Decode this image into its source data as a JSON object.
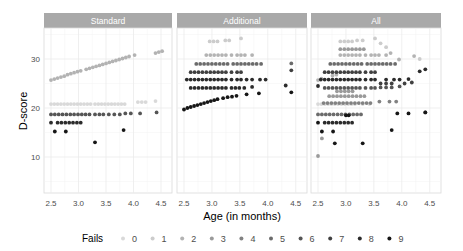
{
  "chart_data": {
    "type": "scatter",
    "title": "",
    "xlabel": "Age (in months)",
    "ylabel": "D-score",
    "xlim": [
      2.4,
      4.6
    ],
    "ylim": [
      3,
      36.5
    ],
    "xticks": [
      2.5,
      3.0,
      3.5,
      4.0,
      4.5
    ],
    "xtick_labels": [
      "2.5",
      "3.0",
      "3.5",
      "4.0",
      "4.5"
    ],
    "yticks": [
      10,
      20,
      30
    ],
    "ytick_labels": [
      "10",
      "20",
      "30"
    ],
    "grid": true,
    "legend_position": "bottom",
    "legend_title": "Fails",
    "legend": [
      {
        "label": "0",
        "color": "#d9d9d9"
      },
      {
        "label": "1",
        "color": "#cccccc"
      },
      {
        "label": "2",
        "color": "#b3b3b3"
      },
      {
        "label": "3",
        "color": "#9a9a9a"
      },
      {
        "label": "4",
        "color": "#828282"
      },
      {
        "label": "5",
        "color": "#6b6b6b"
      },
      {
        "label": "6",
        "color": "#555555"
      },
      {
        "label": "7",
        "color": "#404040"
      },
      {
        "label": "8",
        "color": "#2b2b2b"
      },
      {
        "label": "9",
        "color": "#161616"
      }
    ],
    "panels": [
      {
        "name": "Standard",
        "series": [
          {
            "fails": "2",
            "x": [
              2.5,
              2.56,
              2.62,
              2.68,
              2.74,
              2.8,
              2.86,
              2.92,
              2.98,
              3.04,
              3.14,
              3.2,
              3.26,
              3.32,
              3.38,
              3.44,
              3.5,
              3.56,
              3.62,
              3.68,
              3.74,
              3.8,
              3.86,
              3.92,
              4.02,
              4.4,
              4.46,
              4.52
            ],
            "y": [
              25.7,
              25.9,
              26.1,
              26.3,
              26.5,
              26.8,
              27.0,
              27.2,
              27.4,
              27.6,
              27.9,
              28.1,
              28.3,
              28.5,
              28.7,
              28.9,
              29.1,
              29.3,
              29.5,
              29.7,
              29.9,
              30.1,
              30.3,
              30.5,
              30.8,
              31.2,
              31.4,
              31.6
            ]
          },
          {
            "fails": "0",
            "x": [
              2.5,
              2.56,
              2.62,
              2.68,
              2.74,
              2.8,
              2.86,
              2.92,
              2.98,
              3.04,
              3.1,
              3.16,
              3.22,
              3.3,
              3.36,
              3.42,
              3.48,
              3.54,
              3.6,
              3.66,
              3.72,
              3.78,
              3.84,
              4.08,
              4.15,
              4.22,
              4.4
            ],
            "y": [
              20.8,
              20.8,
              20.8,
              20.8,
              20.8,
              20.8,
              20.8,
              20.8,
              20.8,
              20.8,
              20.8,
              20.8,
              20.8,
              20.8,
              20.8,
              20.8,
              20.8,
              20.8,
              20.8,
              20.8,
              20.8,
              20.8,
              20.8,
              21.2,
              21.2,
              21.2,
              21.4
            ]
          },
          {
            "fails": "6",
            "x": [
              2.5,
              2.57,
              2.64,
              2.71,
              2.78,
              2.85,
              2.92,
              2.99,
              3.06,
              3.13,
              3.2,
              3.3,
              3.38,
              3.45,
              3.55,
              3.65,
              3.75,
              3.85,
              3.95,
              4.12,
              4.42
            ],
            "y": [
              18.7,
              18.7,
              18.7,
              18.7,
              18.7,
              18.7,
              18.7,
              18.7,
              18.7,
              18.7,
              18.7,
              18.7,
              18.7,
              18.7,
              18.7,
              18.7,
              18.7,
              18.9,
              18.9,
              18.9,
              19.1
            ]
          },
          {
            "fails": "8",
            "x": [
              2.5,
              2.62,
              2.69,
              2.76,
              2.83,
              2.9,
              2.97,
              3.04
            ],
            "y": [
              17.0,
              17.0,
              17.0,
              17.0,
              17.0,
              17.0,
              17.0,
              17.0
            ]
          },
          {
            "fails": "9",
            "x": [
              2.57,
              2.77,
              3.3,
              3.82
            ],
            "y": [
              15.2,
              15.2,
              13.0,
              15.5
            ]
          }
        ]
      },
      {
        "name": "Additional",
        "series": [
          {
            "fails": "1",
            "x": [
              2.96,
              3.03,
              3.1,
              3.24,
              3.31,
              3.52
            ],
            "y": [
              33.6,
              33.6,
              33.6,
              33.8,
              33.8,
              34.2
            ]
          },
          {
            "fails": "2",
            "x": [
              2.9,
              2.97,
              3.04,
              3.11,
              3.18,
              3.25,
              3.35,
              3.45,
              3.52,
              3.59,
              3.72
            ],
            "y": [
              30.8,
              30.8,
              30.8,
              30.8,
              30.8,
              30.8,
              30.8,
              30.8,
              30.8,
              30.8,
              30.8
            ]
          },
          {
            "fails": "5",
            "x": [
              2.72,
              2.79,
              2.86,
              2.93,
              3.0,
              3.07,
              3.14,
              3.21,
              3.28,
              3.38,
              3.45,
              3.52,
              3.59,
              3.66,
              3.73,
              3.8,
              3.88,
              4.42
            ],
            "y": [
              29.0,
              29.0,
              29.0,
              29.0,
              29.0,
              29.0,
              29.0,
              29.0,
              29.0,
              29.0,
              29.0,
              29.0,
              29.0,
              29.0,
              29.0,
              29.0,
              29.0,
              29.1
            ]
          },
          {
            "fails": "7",
            "x": [
              2.62,
              2.69,
              2.76,
              2.83,
              2.9,
              2.97,
              3.04,
              3.11,
              3.18,
              3.25,
              3.35,
              3.45,
              3.52,
              4.42
            ],
            "y": [
              27.3,
              27.3,
              27.3,
              27.3,
              27.3,
              27.3,
              27.3,
              27.3,
              27.3,
              27.3,
              27.3,
              27.3,
              27.3,
              27.7
            ]
          },
          {
            "fails": "8",
            "x": [
              2.55,
              2.62,
              2.69,
              2.76,
              2.83,
              2.9,
              2.97,
              3.04,
              3.11,
              3.18,
              3.25,
              3.35,
              3.45,
              3.52,
              3.62,
              3.72,
              3.86,
              3.96
            ],
            "y": [
              25.8,
              25.8,
              25.8,
              25.8,
              25.8,
              25.8,
              25.8,
              25.8,
              25.8,
              25.8,
              25.8,
              25.8,
              25.8,
              25.8,
              25.8,
              25.8,
              25.8,
              25.8
            ]
          },
          {
            "fails": "8",
            "x": [
              2.62,
              2.69,
              2.76,
              2.83,
              2.9,
              2.97,
              3.04,
              3.11,
              3.18,
              3.25,
              3.35,
              3.42,
              3.49,
              3.58,
              3.72,
              4.32
            ],
            "y": [
              24.1,
              24.1,
              24.1,
              24.1,
              24.1,
              24.1,
              24.1,
              24.1,
              24.1,
              24.1,
              24.1,
              24.1,
              24.1,
              24.1,
              24.3,
              24.6
            ]
          },
          {
            "fails": "9",
            "x": [
              2.5,
              2.56,
              2.62,
              2.68,
              2.74,
              2.8,
              2.86,
              2.92,
              2.98,
              3.04,
              3.1,
              3.2,
              3.28,
              3.36,
              3.44,
              3.62,
              3.84,
              4.42
            ],
            "y": [
              19.7,
              20.0,
              20.2,
              20.4,
              20.6,
              20.8,
              21.0,
              21.2,
              21.4,
              21.6,
              21.8,
              22.0,
              22.2,
              22.3,
              22.5,
              22.8,
              23.0,
              23.2
            ]
          }
        ]
      },
      {
        "name": "All",
        "series": [
          {
            "fails": "0",
            "x": [
              2.5,
              2.56,
              2.62,
              2.68,
              2.74,
              2.8,
              2.86,
              2.92,
              2.98,
              3.04,
              3.1,
              3.16,
              3.3,
              3.42
            ],
            "y": [
              20.8,
              20.8,
              20.8,
              20.8,
              20.8,
              20.8,
              20.8,
              20.8,
              20.8,
              20.8,
              20.8,
              20.8,
              20.8,
              20.8
            ]
          },
          {
            "fails": "1",
            "x": [
              2.9,
              2.97,
              3.04,
              3.11,
              3.2,
              3.3,
              3.52,
              3.62,
              3.72,
              4.32
            ],
            "y": [
              33.6,
              33.6,
              33.6,
              33.6,
              33.8,
              33.8,
              34.2,
              33.2,
              32.4,
              30.0
            ]
          },
          {
            "fails": "2",
            "x": [
              2.5,
              2.56,
              2.76,
              2.83,
              2.9,
              2.97,
              3.04,
              3.11,
              3.18,
              3.25,
              3.35,
              3.45,
              3.52,
              3.59,
              3.72,
              3.8,
              3.95,
              4.22
            ],
            "y": [
              25.7,
              26.0,
              26.6,
              26.8,
              30.8,
              30.8,
              30.8,
              30.8,
              30.8,
              30.8,
              30.8,
              30.8,
              30.8,
              30.8,
              30.8,
              31.2,
              29.9,
              30.6
            ]
          },
          {
            "fails": "3",
            "x": [
              2.7,
              2.77,
              2.84,
              2.91,
              2.98,
              3.05,
              3.12,
              3.19,
              3.26,
              3.33,
              2.9,
              2.97,
              3.04,
              3.11,
              3.18,
              3.25,
              3.32,
              2.84,
              2.91,
              2.98,
              3.05,
              3.12
            ],
            "y": [
              22.4,
              22.4,
              22.4,
              22.4,
              22.4,
              22.4,
              22.4,
              22.4,
              22.4,
              22.4,
              32.0,
              32.0,
              32.0,
              32.0,
              32.0,
              32.0,
              32.0,
              23.4,
              23.4,
              23.4,
              23.4,
              23.4
            ]
          },
          {
            "fails": "4",
            "x": [
              2.6,
              2.67,
              2.74,
              2.81,
              2.88,
              2.95,
              3.02,
              3.09,
              3.16,
              3.23,
              3.3,
              3.37,
              3.44,
              3.6,
              3.78,
              3.9
            ],
            "y": [
              21.0,
              21.0,
              21.0,
              21.0,
              21.0,
              21.0,
              21.0,
              21.0,
              21.0,
              21.0,
              21.0,
              21.0,
              21.0,
              21.3,
              21.3,
              21.3
            ]
          },
          {
            "fails": "5",
            "x": [
              2.72,
              2.79,
              2.86,
              2.93,
              3.0,
              3.07,
              3.14,
              3.21,
              3.28,
              3.38,
              3.45,
              3.52,
              3.59,
              3.66,
              3.73,
              3.8,
              3.88,
              2.5,
              2.57,
              2.64,
              2.71,
              2.78,
              2.85,
              2.92,
              2.99,
              3.06,
              3.13,
              3.2,
              3.27
            ],
            "y": [
              29.0,
              29.0,
              29.0,
              29.0,
              29.0,
              29.0,
              29.0,
              29.0,
              29.0,
              29.0,
              29.0,
              29.0,
              29.0,
              29.0,
              29.0,
              29.0,
              29.0,
              18.7,
              18.7,
              18.7,
              18.7,
              18.7,
              18.7,
              18.7,
              18.7,
              18.7,
              18.7,
              18.7,
              18.7
            ]
          },
          {
            "fails": "6",
            "x": [
              2.62,
              2.69,
              2.76,
              2.83,
              2.9,
              2.97,
              3.04,
              3.11,
              3.18,
              3.25,
              3.35,
              3.45,
              3.52,
              3.62,
              3.72,
              3.82,
              3.96,
              4.42
            ],
            "y": [
              24.1,
              24.1,
              24.1,
              24.1,
              24.1,
              24.1,
              24.1,
              24.1,
              24.1,
              24.1,
              24.1,
              24.1,
              24.1,
              24.2,
              24.2,
              24.2,
              24.4,
              19.1
            ]
          },
          {
            "fails": "7",
            "x": [
              2.62,
              2.69,
              2.76,
              2.83,
              2.9,
              2.97,
              3.04,
              3.11,
              3.18,
              3.25,
              3.35,
              3.45,
              3.52,
              3.62,
              3.72,
              3.82,
              4.05,
              4.18
            ],
            "y": [
              27.3,
              27.3,
              27.3,
              27.3,
              27.3,
              27.3,
              27.3,
              27.3,
              27.3,
              27.3,
              27.3,
              27.3,
              27.3,
              25.0,
              25.0,
              25.0,
              25.0,
              25.2
            ]
          },
          {
            "fails": "8",
            "x": [
              2.5,
              2.55,
              2.62,
              2.69,
              2.76,
              2.83,
              2.9,
              2.97,
              3.04,
              3.11,
              3.18,
              3.25,
              3.35,
              3.45,
              3.52,
              3.72,
              3.86,
              3.96,
              4.12,
              4.32,
              4.42,
              2.62,
              2.69,
              2.76,
              2.83,
              2.9,
              2.97,
              3.04,
              3.11
            ],
            "y": [
              24.5,
              25.8,
              25.8,
              25.8,
              25.8,
              25.8,
              25.8,
              25.8,
              25.8,
              25.8,
              25.8,
              25.8,
              25.8,
              25.8,
              25.8,
              25.8,
              25.8,
              25.8,
              25.9,
              27.5,
              27.9,
              17.0,
              17.0,
              17.0,
              17.0,
              17.0,
              17.0,
              17.0,
              17.0
            ]
          },
          {
            "fails": "9",
            "x": [
              2.5,
              2.57,
              2.77,
              2.8,
              3.3,
              3.82,
              3.92,
              4.12,
              4.42,
              3.0,
              3.05
            ],
            "y": [
              17.0,
              15.2,
              15.2,
              12.8,
              12.8,
              15.5,
              18.9,
              18.9,
              19.1,
              18.5,
              18.5
            ]
          },
          {
            "fails": "3",
            "x": [
              2.5,
              2.57
            ],
            "y": [
              10.2,
              13.8
            ]
          }
        ]
      }
    ]
  }
}
